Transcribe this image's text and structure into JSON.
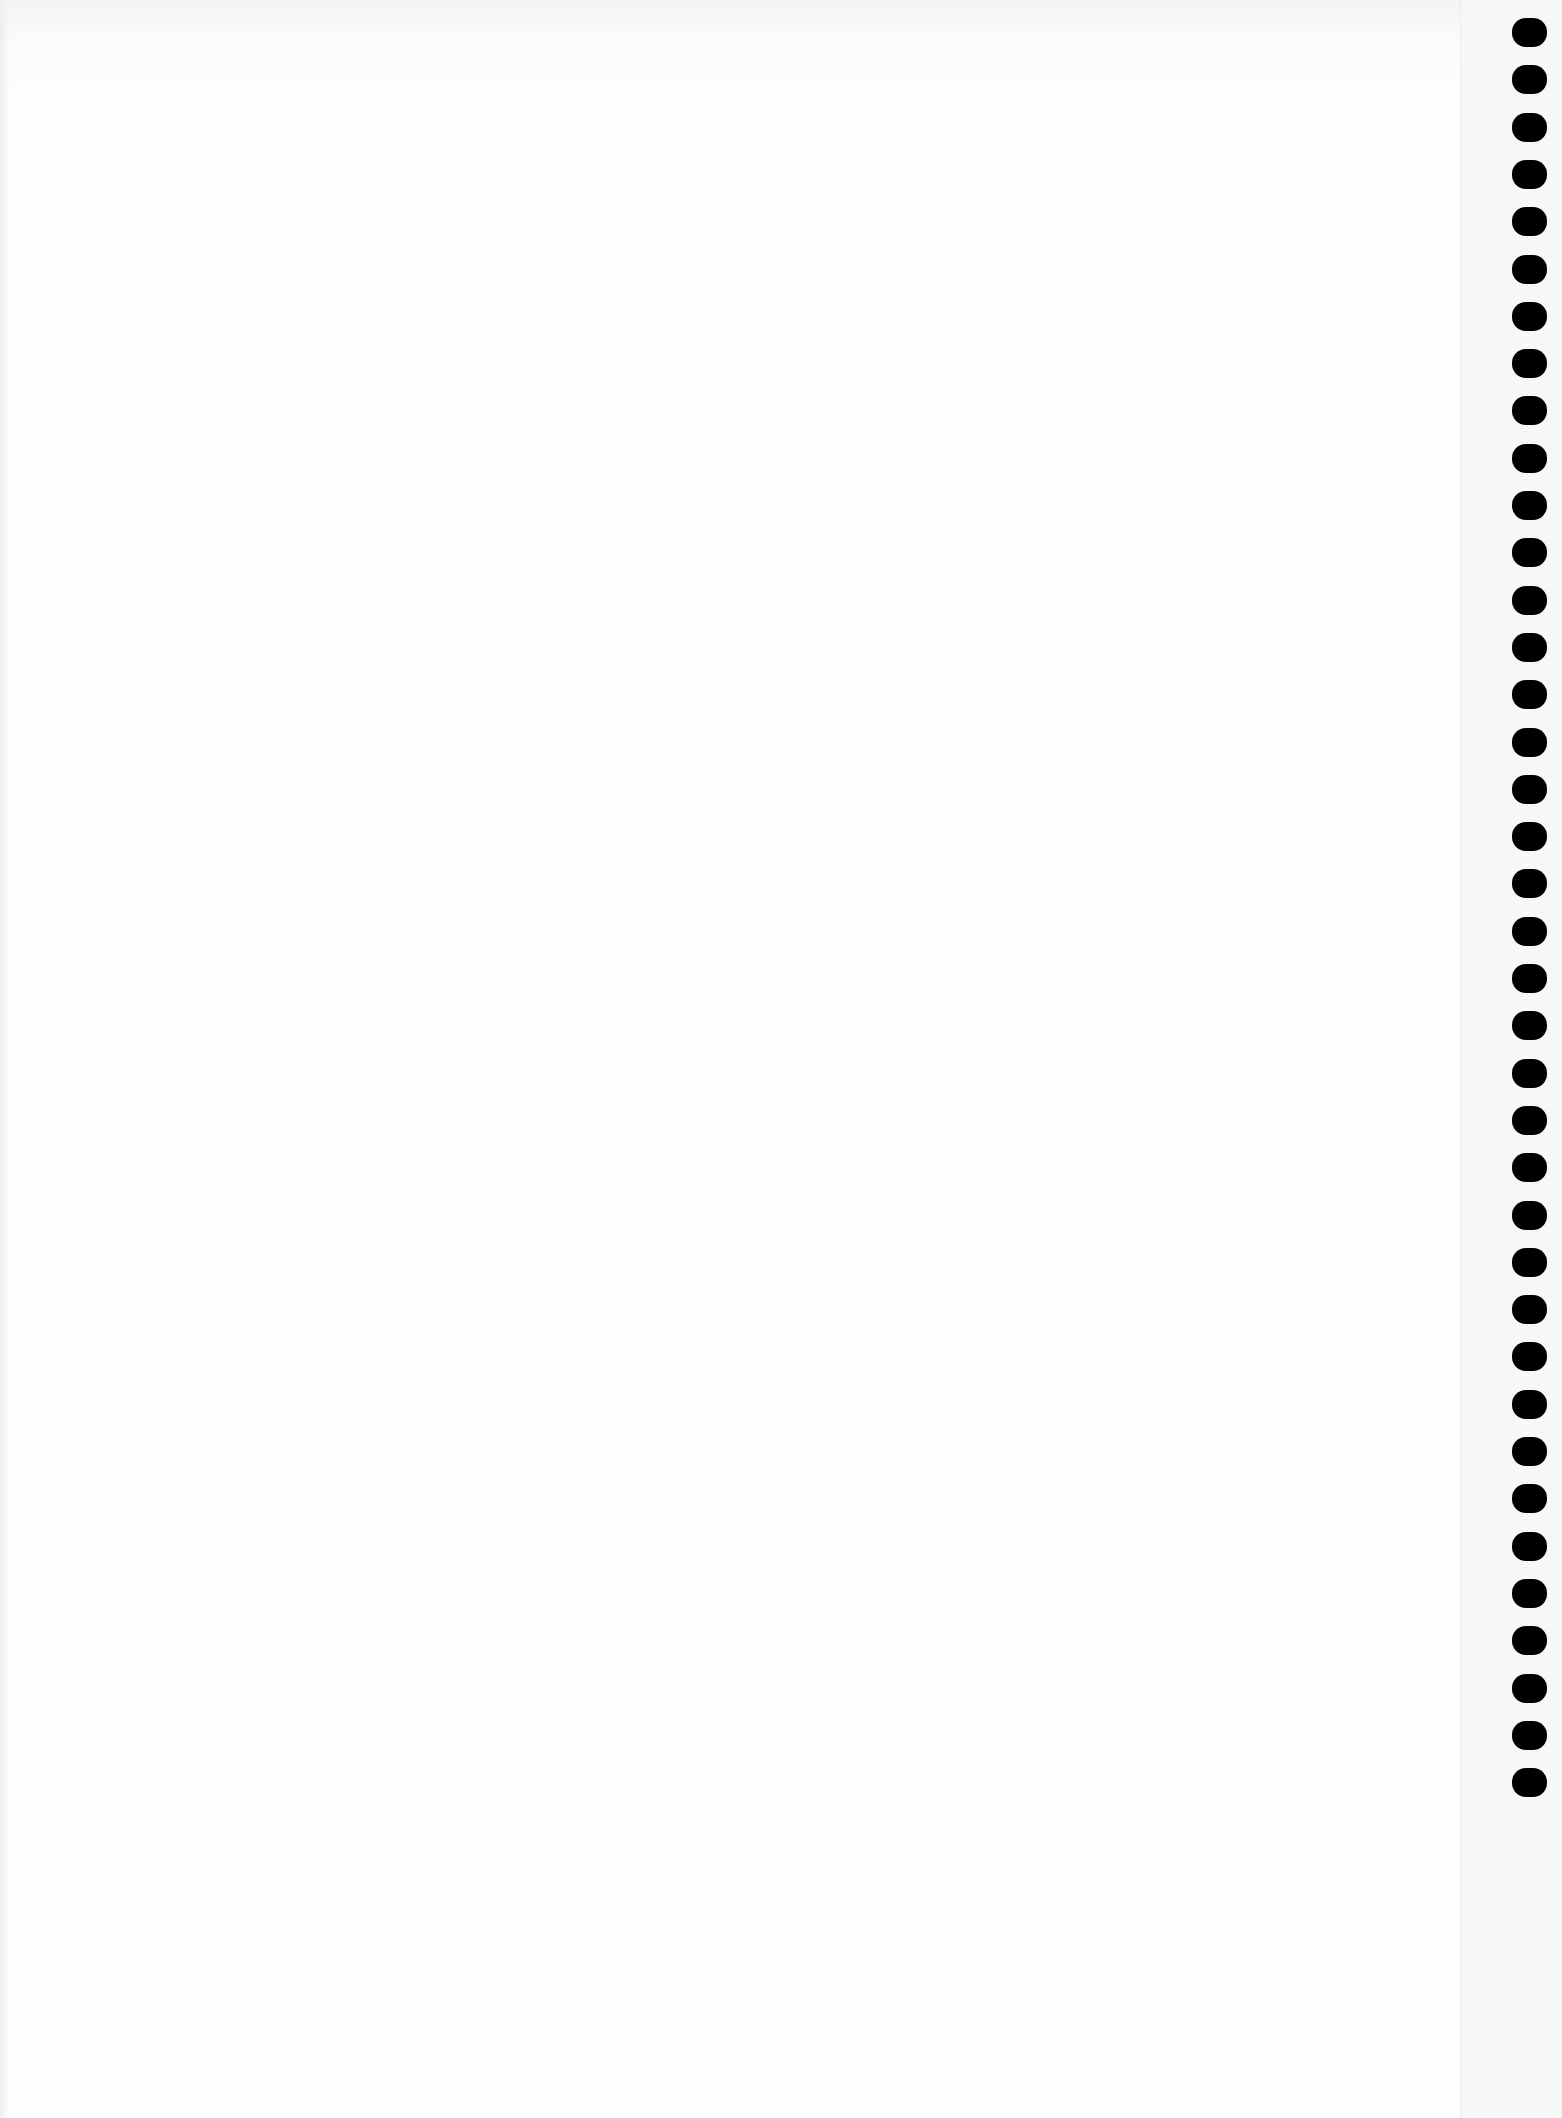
{
  "page": {
    "type": "blank notebook page",
    "background_color": "#fdfdfd",
    "text_content": ""
  },
  "binding": {
    "side": "right",
    "hole_count": 38,
    "hole_color": "#000000",
    "hole_x": 1512,
    "hole_first_top": 18,
    "hole_pitch": 47.3,
    "hole_width": 35,
    "hole_height": 29
  },
  "perforation": {
    "x": 1460,
    "style": "dotted",
    "color": "#e2e2e2"
  }
}
